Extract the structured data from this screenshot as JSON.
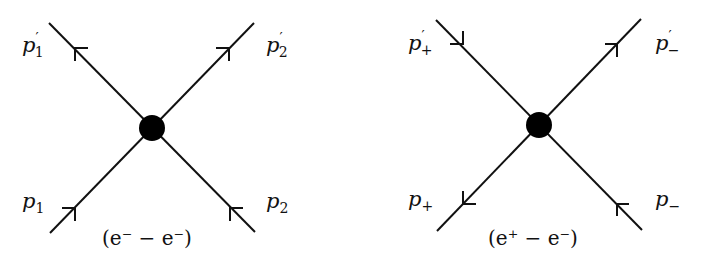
{
  "diagrams": [
    {
      "name": "electron-electron",
      "caption": "(e⁻ − e⁻)",
      "labels": {
        "top_left": {
          "base": "p",
          "prime": "′",
          "sub": "1"
        },
        "top_right": {
          "base": "p",
          "prime": "′",
          "sub": "2"
        },
        "bottom_left": {
          "base": "p",
          "sub": "1"
        },
        "bottom_right": {
          "base": "p",
          "sub": "2"
        }
      },
      "arrows": {
        "top_left": "outgoing",
        "top_right": "outgoing",
        "bottom_left": "incoming",
        "bottom_right": "incoming"
      }
    },
    {
      "name": "positron-electron",
      "caption": "(e⁺ − e⁻)",
      "labels": {
        "top_left": {
          "base": "p",
          "prime": "′",
          "sub": "+"
        },
        "top_right": {
          "base": "p",
          "prime": "′",
          "sub": "−"
        },
        "bottom_left": {
          "base": "p",
          "sub": "+"
        },
        "bottom_right": {
          "base": "p",
          "sub": "−"
        }
      },
      "arrows": {
        "top_left": "incoming",
        "top_right": "outgoing",
        "bottom_left": "outgoing",
        "bottom_right": "incoming"
      }
    }
  ]
}
